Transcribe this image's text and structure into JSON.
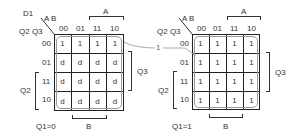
{
  "title": "D1",
  "var_labels": {
    "col": "A B",
    "row": "Q2 Q3"
  },
  "col_headers": [
    "00",
    "01",
    "11",
    "10"
  ],
  "row_headers": [
    "00",
    "01",
    "11",
    "10"
  ],
  "bracket_labels": {
    "a": "A",
    "b": "B",
    "q2": "Q2",
    "q3": "Q3"
  },
  "connector_label": "1",
  "maps": [
    {
      "caption": "Q1=0",
      "cells": [
        [
          "1",
          "1",
          "1",
          "1"
        ],
        [
          "d",
          "d",
          "d",
          "d"
        ],
        [
          "d",
          "d",
          "d",
          "d"
        ],
        [
          "d",
          "d",
          "d",
          "d"
        ]
      ]
    },
    {
      "caption": "Q1=1",
      "cells": [
        [
          "1",
          "1",
          "1",
          "1"
        ],
        [
          "1",
          "1",
          "1",
          "1"
        ],
        [
          "1",
          "1",
          "1",
          "1"
        ],
        [
          "1",
          "1",
          "1",
          "1"
        ]
      ]
    }
  ],
  "colors": {
    "line": "#222222",
    "loop": "#999999",
    "text": "#333333"
  }
}
